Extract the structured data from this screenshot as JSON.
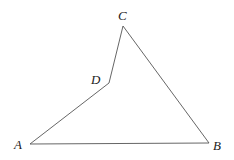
{
  "diagram": {
    "type": "quadrilateral",
    "stroke_color": "#555555",
    "label_color": "#222222",
    "background": "#ffffff",
    "points": {
      "A": {
        "label": "A",
        "x": 30,
        "y": 144,
        "label_x": 21,
        "label_y": 149
      },
      "B": {
        "label": "B",
        "x": 209,
        "y": 143,
        "label_x": 214,
        "label_y": 150
      },
      "C": {
        "label": "C",
        "x": 123,
        "y": 26,
        "label_x": 119,
        "label_y": 20
      },
      "D": {
        "label": "D",
        "x": 109,
        "y": 83,
        "label_x": 92,
        "label_y": 84
      }
    },
    "edges": [
      [
        "A",
        "B"
      ],
      [
        "B",
        "C"
      ],
      [
        "C",
        "D"
      ],
      [
        "D",
        "A"
      ]
    ]
  }
}
